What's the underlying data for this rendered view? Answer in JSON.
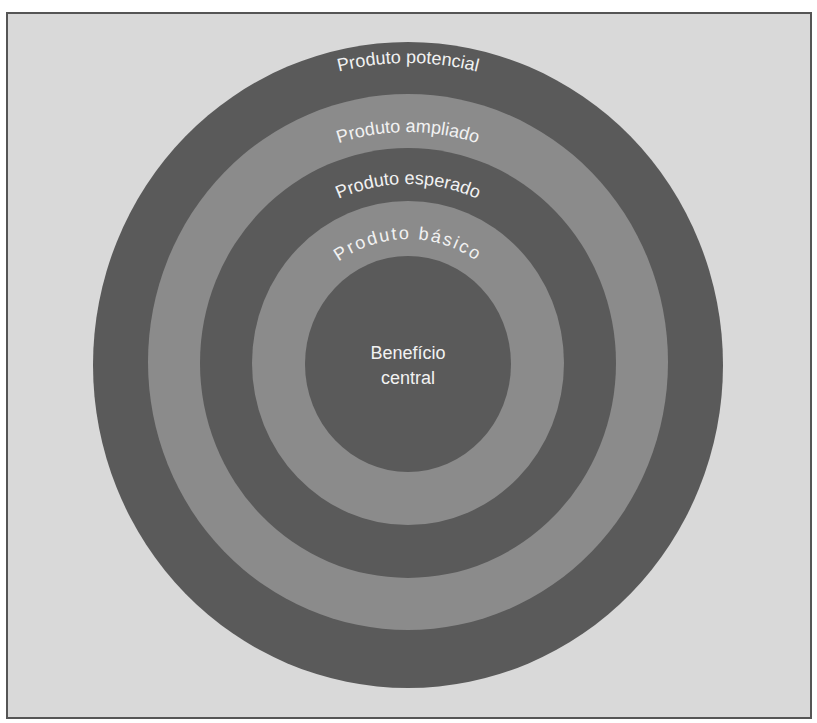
{
  "diagram": {
    "type": "concentric-rings",
    "colors": {
      "background": "#d9d9d9",
      "frame_border": "#555555",
      "dark_ring": "#5a5a5a",
      "light_ring": "#8b8b8b",
      "text": "#f2f2f2"
    },
    "levels": [
      {
        "label": "Produto potencial",
        "shade": "dark"
      },
      {
        "label": "Produto ampliado",
        "shade": "light"
      },
      {
        "label": "Produto esperado",
        "shade": "dark"
      },
      {
        "label": "Produto básico",
        "shade": "light"
      },
      {
        "label_line1": "Benefício",
        "label_line2": "central",
        "shade": "dark"
      }
    ]
  }
}
